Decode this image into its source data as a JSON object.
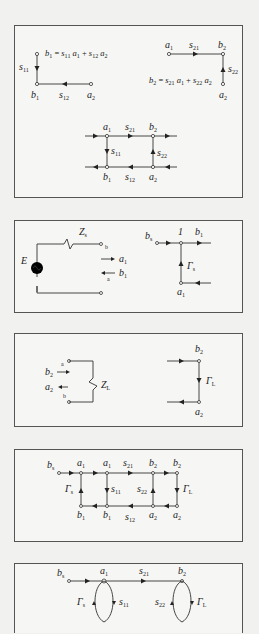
{
  "figure": {
    "panels": [
      {
        "id": "s-parameter-subgraphs",
        "equations": [
          "b1 = s11 a1 + s12 a2",
          "b2 = s21 a1 + s22 a2"
        ],
        "labels": {
          "b": "b",
          "a": "a",
          "s": "s",
          "sub_1": "1",
          "sub_2": "2",
          "sub_11": "11",
          "sub_12": "12",
          "sub_21": "21",
          "sub_22": "22",
          "eq_op": "=",
          "eq_plus": "+"
        }
      },
      {
        "id": "source-model",
        "labels": {
          "source": "E",
          "impedance": "Z",
          "impedance_sub": "s",
          "port_b": "b",
          "port_a": "a",
          "wave_a": "a",
          "wave_b": "b",
          "sub_1": "1",
          "unity_gain": "1",
          "node_bs": "b",
          "node_bs_sub": "s",
          "reflection": "Γ",
          "reflection_sub": "s"
        }
      },
      {
        "id": "load-model",
        "labels": {
          "wave_b": "b",
          "wave_a": "a",
          "sub_2": "2",
          "port_a": "a",
          "port_b": "b",
          "impedance": "Z",
          "impedance_sub": "L",
          "reflection": "Γ",
          "reflection_sub": "L"
        }
      },
      {
        "id": "full-flow-graph",
        "labels": {
          "source_node": "b",
          "source_sub": "s",
          "gamma": "Γ",
          "gamma_s_sub": "s",
          "gamma_l_sub": "L"
        }
      },
      {
        "id": "reduced-flow-graph",
        "labels": {
          "source_node": "b",
          "source_sub": "s",
          "gamma": "Γ",
          "gamma_s_sub": "s",
          "gamma_l_sub": "L"
        }
      }
    ]
  }
}
